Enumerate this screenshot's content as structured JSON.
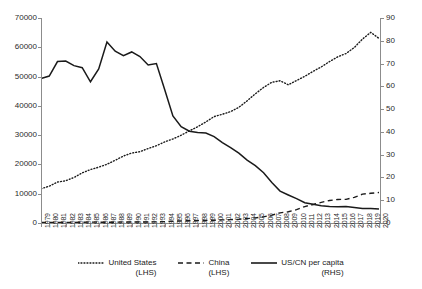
{
  "chart_data": {
    "type": "line",
    "title": "",
    "xlabel": "",
    "ylabel": "",
    "grid": false,
    "legend_position": "bottom",
    "x": [
      1979,
      1980,
      1981,
      1982,
      1983,
      1984,
      1985,
      1986,
      1987,
      1988,
      1989,
      1990,
      1991,
      1992,
      1993,
      1994,
      1995,
      1996,
      1997,
      1998,
      1999,
      2000,
      2001,
      2002,
      2003,
      2004,
      2005,
      2006,
      2007,
      2008,
      2009,
      2010,
      2011,
      2012,
      2013,
      2014,
      2015,
      2016,
      2017,
      2018,
      2019,
      2020
    ],
    "xtick_labels": [
      "1979",
      "1980",
      "1981",
      "1982",
      "1983",
      "1984",
      "1985",
      "1986",
      "1987",
      "1988",
      "1989",
      "1990",
      "1991",
      "1992",
      "1993",
      "1994",
      "1995",
      "1996",
      "1997",
      "1998",
      "1999",
      "2000",
      "2001",
      "2002",
      "2003",
      "2004",
      "2005",
      "2006",
      "2007",
      "2008",
      "2009",
      "2010",
      "2011",
      "2012",
      "2013",
      "2014",
      "2015",
      "2016",
      "2017",
      "2018",
      "2019",
      "2020"
    ],
    "axes": {
      "left": {
        "label": "",
        "ylim": [
          0,
          70000
        ],
        "ticks": [
          0,
          10000,
          20000,
          30000,
          40000,
          50000,
          60000,
          70000
        ],
        "tick_labels": [
          "0",
          "10000",
          "20000",
          "30000",
          "40000",
          "50000",
          "60000",
          "70000"
        ]
      },
      "right": {
        "label": "",
        "ylim": [
          0,
          90
        ],
        "ticks": [
          0,
          10,
          20,
          30,
          40,
          50,
          60,
          70,
          80,
          90
        ],
        "tick_labels": [
          "0",
          "10",
          "20",
          "30",
          "40",
          "50",
          "60",
          "70",
          "80",
          "90"
        ]
      }
    },
    "series": [
      {
        "name": "United States",
        "legend_label": "United States",
        "legend_sub": "(LHS)",
        "axis": "left",
        "style": "dotted",
        "color": "#1a1a1a",
        "values": [
          11674,
          12575,
          13976,
          14434,
          15544,
          17121,
          18237,
          19071,
          20039,
          21417,
          22857,
          23889,
          24342,
          25419,
          26387,
          27695,
          28691,
          29968,
          31459,
          32854,
          34515,
          36330,
          37134,
          38023,
          39496,
          41713,
          44115,
          46299,
          48050,
          48570,
          47195,
          48651,
          50066,
          51784,
          53291,
          55124,
          56763,
          57867,
          59915,
          62805,
          65095,
          63028
        ]
      },
      {
        "name": "China",
        "legend_label": "China",
        "legend_sub": "(LHS)",
        "axis": "left",
        "style": "dashed",
        "color": "#1a1a1a",
        "values": [
          184,
          195,
          197,
          203,
          225,
          251,
          294,
          282,
          252,
          284,
          311,
          318,
          333,
          366,
          377,
          473,
          610,
          709,
          781,
          828,
          873,
          959,
          1053,
          1148,
          1288,
          1509,
          1753,
          2099,
          2693,
          3468,
          3832,
          4550,
          5618,
          6317,
          7051,
          7679,
          8034,
          8079,
          8760,
          9849,
          10144,
          10409
        ]
      },
      {
        "name": "US/CN per capita",
        "legend_label": "US/CN per capita",
        "legend_sub": "(RHS)",
        "axis": "right",
        "style": "solid",
        "color": "#1a1a1a",
        "values": [
          63.4,
          64.5,
          70.9,
          71.1,
          69.1,
          68.2,
          62.0,
          67.6,
          79.5,
          75.4,
          73.5,
          75.1,
          73.1,
          69.4,
          70.0,
          58.6,
          47.0,
          42.3,
          40.3,
          39.7,
          39.5,
          37.9,
          35.3,
          33.1,
          30.7,
          27.6,
          25.2,
          22.1,
          17.8,
          14.0,
          12.3,
          10.7,
          8.9,
          8.2,
          7.6,
          7.2,
          7.1,
          7.2,
          6.8,
          6.4,
          6.4,
          6.1
        ]
      }
    ]
  },
  "legend": {
    "items": [
      {
        "label": "United States",
        "sub": "(LHS)",
        "style": "dotted"
      },
      {
        "label": "China",
        "sub": "(LHS)",
        "style": "dashed"
      },
      {
        "label": "US/CN per capita",
        "sub": "(RHS)",
        "style": "solid"
      }
    ]
  }
}
